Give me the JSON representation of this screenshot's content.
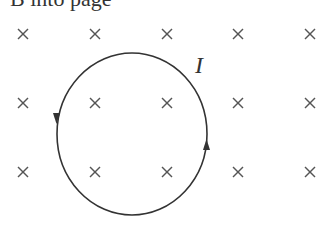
{
  "caption": "B into page",
  "current_label": "I",
  "field_symbol": "×",
  "grid": {
    "columns_x": [
      23,
      95,
      167,
      238,
      310
    ],
    "rows_y": [
      34,
      103,
      172
    ]
  },
  "loop": {
    "cx": 132,
    "cy": 134,
    "rx": 75,
    "ry": 81,
    "direction": "counterclockwise",
    "stroke": "#333333"
  },
  "colors": {
    "ink": "#333333",
    "field": "#555555"
  }
}
